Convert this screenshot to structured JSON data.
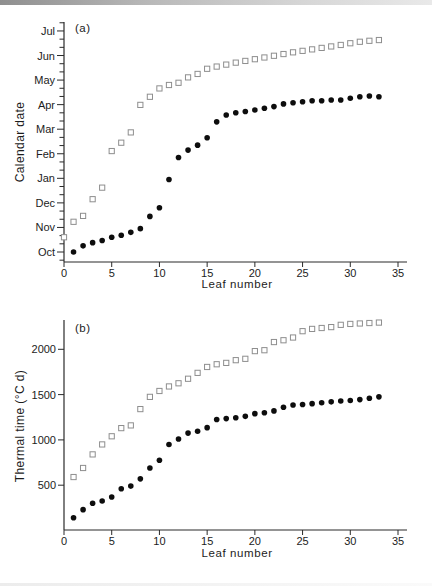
{
  "colors": {
    "background": "#ffffff",
    "axis": "#2a2a2a",
    "circle_fill": "#0d0d0d",
    "square_outline": "#8e8e8e",
    "top_strip": "#9e9e9e"
  },
  "chart_data": [
    {
      "type": "scatter",
      "panel_label": "(a)",
      "xlabel": "Leaf number",
      "ylabel": "Calendar date",
      "xlim": [
        0,
        36
      ],
      "x_ticks": [
        0,
        5,
        10,
        15,
        20,
        25,
        30,
        35
      ],
      "y_tick_labels": [
        "Oct",
        "Nov",
        "Dec",
        "Jan",
        "Feb",
        "Mar",
        "Apr",
        "May",
        "Jun",
        "Jul"
      ],
      "y_value_meaning": "months after 1 October (0 = Oct, 9 = Jul); minor ticks every 1/3 month",
      "ylim": [
        -0.41,
        9.36
      ],
      "grid": false,
      "legend": "none",
      "series": [
        {
          "name": "open squares",
          "marker": "open-square",
          "x": [
            0,
            1,
            2,
            3,
            4,
            5,
            6,
            7,
            8,
            9,
            10,
            11,
            12,
            13,
            14,
            15,
            16,
            17,
            18,
            19,
            20,
            21,
            22,
            23,
            24,
            25,
            26,
            27,
            28,
            29,
            30,
            31,
            32,
            33
          ],
          "y": [
            0.6,
            1.23,
            1.47,
            2.15,
            2.62,
            4.11,
            4.45,
            4.87,
            5.99,
            6.32,
            6.66,
            6.8,
            6.89,
            7.11,
            7.25,
            7.46,
            7.55,
            7.63,
            7.71,
            7.78,
            7.85,
            7.92,
            7.99,
            8.06,
            8.13,
            8.19,
            8.25,
            8.31,
            8.37,
            8.43,
            8.5,
            8.56,
            8.6,
            8.63
          ]
        },
        {
          "name": "filled circles",
          "marker": "filled-circle",
          "x": [
            1,
            2,
            3,
            4,
            5,
            6,
            7,
            8,
            9,
            10,
            11,
            12,
            13,
            14,
            15,
            16,
            17,
            18,
            19,
            20,
            21,
            22,
            23,
            24,
            25,
            26,
            27,
            28,
            29,
            30,
            31,
            32,
            33
          ],
          "y": [
            0.0,
            0.25,
            0.38,
            0.47,
            0.6,
            0.68,
            0.8,
            0.95,
            1.45,
            1.8,
            2.95,
            3.85,
            4.15,
            4.35,
            4.65,
            5.3,
            5.58,
            5.67,
            5.72,
            5.78,
            5.85,
            5.92,
            6.03,
            6.08,
            6.12,
            6.16,
            6.16,
            6.19,
            6.19,
            6.26,
            6.32,
            6.35,
            6.32
          ]
        }
      ]
    },
    {
      "type": "scatter",
      "panel_label": "(b)",
      "xlabel": "Leaf number",
      "ylabel": "Thermal time (°C d)",
      "xlim": [
        0,
        36
      ],
      "x_ticks": [
        0,
        5,
        10,
        15,
        20,
        25,
        30,
        35
      ],
      "y_ticks": [
        500,
        1000,
        1500,
        2000
      ],
      "ylim": [
        0,
        2320
      ],
      "grid": false,
      "legend": "none",
      "series": [
        {
          "name": "open squares",
          "marker": "open-square",
          "x": [
            1,
            2,
            3,
            4,
            5,
            6,
            7,
            8,
            9,
            10,
            11,
            12,
            13,
            14,
            15,
            16,
            17,
            18,
            19,
            20,
            21,
            22,
            23,
            24,
            25,
            26,
            27,
            28,
            29,
            30,
            31,
            32,
            33
          ],
          "y": [
            590,
            690,
            840,
            950,
            1040,
            1130,
            1160,
            1340,
            1475,
            1540,
            1590,
            1625,
            1675,
            1740,
            1805,
            1835,
            1850,
            1880,
            1895,
            1980,
            1990,
            2080,
            2100,
            2130,
            2200,
            2225,
            2235,
            2245,
            2270,
            2280,
            2285,
            2290,
            2295
          ]
        },
        {
          "name": "filled circles",
          "marker": "filled-circle",
          "x": [
            1,
            2,
            3,
            4,
            5,
            6,
            7,
            8,
            9,
            10,
            11,
            12,
            13,
            14,
            15,
            16,
            17,
            18,
            19,
            20,
            21,
            22,
            23,
            24,
            25,
            26,
            27,
            28,
            29,
            30,
            31,
            32,
            33
          ],
          "y": [
            140,
            230,
            300,
            325,
            370,
            460,
            490,
            570,
            690,
            775,
            950,
            1010,
            1075,
            1095,
            1135,
            1225,
            1235,
            1245,
            1260,
            1290,
            1300,
            1320,
            1360,
            1385,
            1390,
            1400,
            1410,
            1420,
            1430,
            1435,
            1445,
            1460,
            1475
          ]
        }
      ]
    }
  ]
}
